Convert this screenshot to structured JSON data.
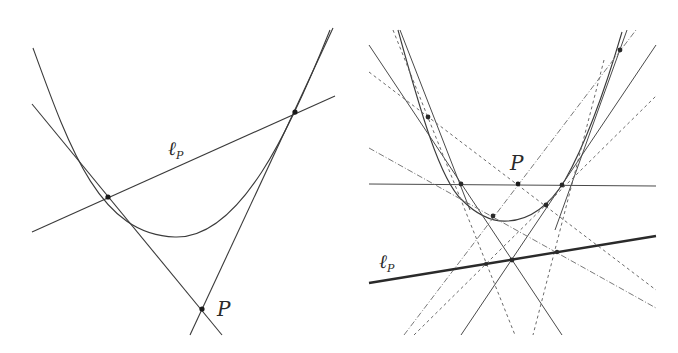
{
  "figure": {
    "left_panel": {
      "labels": {
        "line_name": "ℓ",
        "line_subscript": "P",
        "point_name": "P"
      }
    },
    "right_panel": {
      "labels": {
        "line_name": "ℓ",
        "line_subscript": "P",
        "point_name": "P"
      }
    }
  },
  "colors": {
    "ink": "#3a3a3a",
    "thick_line": "#2a2a2a",
    "dashed": "#6a6a6a",
    "background": "#ffffff"
  }
}
